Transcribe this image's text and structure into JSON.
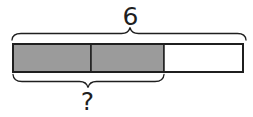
{
  "diagram": {
    "kind": "tape-diagram",
    "total_label": "6",
    "unknown_label": "?",
    "segments": [
      {
        "shaded": true
      },
      {
        "shaded": true
      },
      {
        "shaded": false
      }
    ],
    "colors": {
      "shaded_fill": "#9b9b9b",
      "unshaded_fill": "#ffffff",
      "line": "#1f1f1f",
      "text": "#1f1f1f"
    }
  }
}
